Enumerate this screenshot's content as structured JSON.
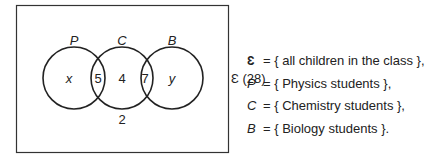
{
  "diagram": {
    "type": "venn",
    "universe_label": "Ɛ (28)",
    "sets": [
      {
        "name": "P",
        "cx": 74,
        "cy": 78,
        "r": 31
      },
      {
        "name": "C",
        "cx": 122,
        "cy": 78,
        "r": 31
      },
      {
        "name": "B",
        "cx": 172,
        "cy": 78,
        "r": 31
      }
    ],
    "regions": {
      "p_only": "x",
      "p_and_c": "5",
      "c_only": "4",
      "c_and_b": "7",
      "b_only": "y",
      "outside": "2"
    }
  },
  "legend": [
    {
      "symbol": "Ɛ",
      "text": "= { all children in the class },"
    },
    {
      "symbol": "P",
      "text": "= { Physics students },"
    },
    {
      "symbol": "C",
      "text": "= { Chemistry students },"
    },
    {
      "symbol": "B",
      "text": "= { Biology students }."
    }
  ]
}
